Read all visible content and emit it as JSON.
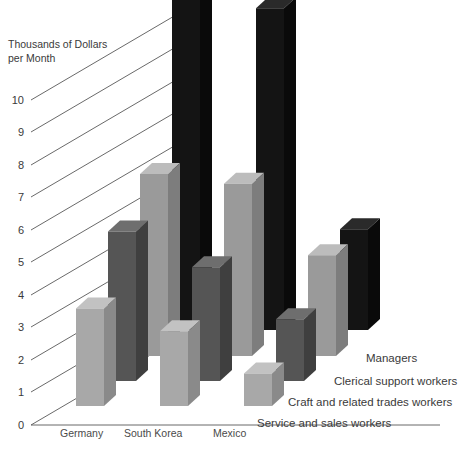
{
  "chart_data": {
    "type": "bar",
    "title": "",
    "ylabel_line1": "Thousands of Dollars",
    "ylabel_line2": "per Month",
    "xlabel": "",
    "categories": [
      "Germany",
      "South Korea",
      "Mexico"
    ],
    "series": [
      {
        "name": "Service and sales workers",
        "color": "#a8a8a8",
        "values": [
          3.0,
          2.3,
          1.0
        ]
      },
      {
        "name": "Craft and related trades workers",
        "color": "#555555",
        "values": [
          4.6,
          3.5,
          1.9
        ]
      },
      {
        "name": "Clerical support workers",
        "color": "#9a9a9a",
        "values": [
          5.6,
          5.3,
          3.1
        ]
      },
      {
        "name": "Managers",
        "color": "#141414",
        "values": [
          13.2,
          9.9,
          3.1
        ]
      }
    ],
    "yticks": [
      0,
      1,
      2,
      3,
      4,
      5,
      6,
      7,
      8,
      9,
      10
    ],
    "ylim": [
      0,
      10
    ],
    "grid": true,
    "legend_position": "right-diagonal",
    "projection": "3d-isometric"
  },
  "legend": {
    "entries": [
      {
        "label": "Managers",
        "color": "#141414"
      },
      {
        "label": "Clerical support workers",
        "color": "#9a9a9a"
      },
      {
        "label": "Craft and related trades workers",
        "color": "#555555"
      },
      {
        "label": "Service and sales workers",
        "color": "#a8a8a8"
      }
    ]
  },
  "axis": {
    "y_title_line1": "Thousands of Dollars",
    "y_title_line2": "per Month",
    "tick_10": "10",
    "tick_9": "9",
    "tick_8": "8",
    "tick_7": "7",
    "tick_6": "6",
    "tick_5": "5",
    "tick_4": "4",
    "tick_3": "3",
    "tick_2": "2",
    "tick_1": "1",
    "tick_0": "0"
  },
  "categories": {
    "germany": "Germany",
    "south_korea": "South Korea",
    "mexico": "Mexico"
  },
  "colors": {
    "series_light": "#a8a8a8",
    "series_dark": "#555555",
    "series_mid": "#9a9a9a",
    "series_black": "#141414",
    "grid": "#585858",
    "text": "#3a3a3a",
    "background": "#ffffff"
  }
}
